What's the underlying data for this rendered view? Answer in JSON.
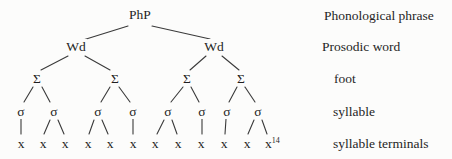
{
  "tree": {
    "root": {
      "label": "PhP"
    },
    "words": [
      {
        "label": "Wd"
      },
      {
        "label": "Wd"
      }
    ],
    "feet": [
      {
        "label": "Σ"
      },
      {
        "label": "Σ"
      },
      {
        "label": "Σ"
      },
      {
        "label": "Σ"
      }
    ],
    "syllables": [
      {
        "label": "σ"
      },
      {
        "label": "σ"
      },
      {
        "label": "σ"
      },
      {
        "label": "σ"
      },
      {
        "label": "σ"
      },
      {
        "label": "σ"
      },
      {
        "label": "σ"
      },
      {
        "label": "σ"
      }
    ],
    "terminals": [
      {
        "label": "x"
      },
      {
        "label": "x"
      },
      {
        "label": "x"
      },
      {
        "label": "x"
      },
      {
        "label": "x"
      },
      {
        "label": "x"
      },
      {
        "label": "x"
      },
      {
        "label": "x"
      },
      {
        "label": "x"
      },
      {
        "label": "x"
      },
      {
        "label": "x"
      },
      {
        "label": "x",
        "superscript": "14"
      }
    ]
  },
  "legend": {
    "items": [
      {
        "label": "Phonological phrase"
      },
      {
        "label": "Prosodic word"
      },
      {
        "label": "foot"
      },
      {
        "label": "syllable"
      },
      {
        "label": "syllable terminals"
      }
    ]
  }
}
